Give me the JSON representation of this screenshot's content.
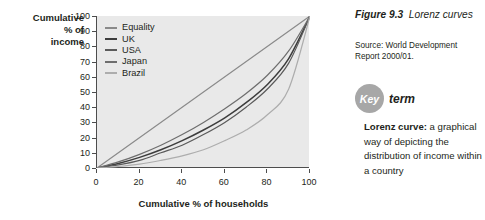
{
  "chart_data": {
    "type": "line",
    "title": "",
    "xlabel": "Cumulative % of households",
    "ylabel": "Cumulative % of income",
    "xlim": [
      0,
      100
    ],
    "ylim": [
      0,
      100
    ],
    "xticks": [
      0,
      20,
      40,
      60,
      80,
      100
    ],
    "yticks": [
      0,
      10,
      20,
      30,
      40,
      50,
      60,
      70,
      80,
      90,
      100
    ],
    "grid": false,
    "legend_position": "top-left",
    "x": [
      0,
      10,
      20,
      30,
      40,
      50,
      60,
      70,
      80,
      90,
      100
    ],
    "series": [
      {
        "name": "Equality",
        "color": "#8a8a8a",
        "values": [
          0,
          10,
          20,
          30,
          40,
          50,
          60,
          70,
          80,
          90,
          100
        ]
      },
      {
        "name": "UK",
        "color": "#3d3d3d",
        "values": [
          0,
          3,
          7,
          12,
          18,
          25,
          33,
          43,
          55,
          72,
          100
        ]
      },
      {
        "name": "USA",
        "color": "#5a5a5a",
        "values": [
          0,
          2,
          5,
          10,
          15,
          22,
          30,
          40,
          52,
          69,
          100
        ]
      },
      {
        "name": "Japan",
        "color": "#6e6e6e",
        "values": [
          0,
          4,
          9,
          15,
          22,
          30,
          39,
          49,
          61,
          77,
          100
        ]
      },
      {
        "name": "Brazil",
        "color": "#adadad",
        "values": [
          0,
          1,
          2.5,
          5,
          8,
          12,
          18,
          25,
          35,
          52,
          100
        ]
      }
    ]
  },
  "chart": {
    "y_axis_title": "Cumulative\n% of\nincome",
    "y_axis_title_lines": [
      "Cumulative",
      "% of",
      "income"
    ],
    "x_axis_title": "Cumulative % of households",
    "legend": [
      {
        "label": "Equality",
        "color": "#8a8a8a"
      },
      {
        "label": "UK",
        "color": "#3d3d3d"
      },
      {
        "label": "USA",
        "color": "#5a5a5a"
      },
      {
        "label": "Japan",
        "color": "#6e6e6e"
      },
      {
        "label": "Brazil",
        "color": "#adadad"
      }
    ],
    "y_tick_labels": [
      "100",
      "90",
      "80",
      "70",
      "60",
      "50",
      "40",
      "30",
      "20",
      "10",
      "0"
    ],
    "x_tick_labels": [
      "0",
      "20",
      "40",
      "60",
      "80",
      "100"
    ],
    "plot_background": "#e9e9e9",
    "axis_color": "#4d4d4d"
  },
  "sidebar": {
    "figure_number": "Figure 9.3",
    "figure_title": "Lorenz curves",
    "source": "Source: World Development Report 2000/01.",
    "key_badge": "Key",
    "key_word": "term",
    "key_term_name": "Lorenz curve:",
    "key_term_definition": " a graphical way of depicting the distribution of income within a country",
    "badge_color": "#a7a7a7"
  }
}
